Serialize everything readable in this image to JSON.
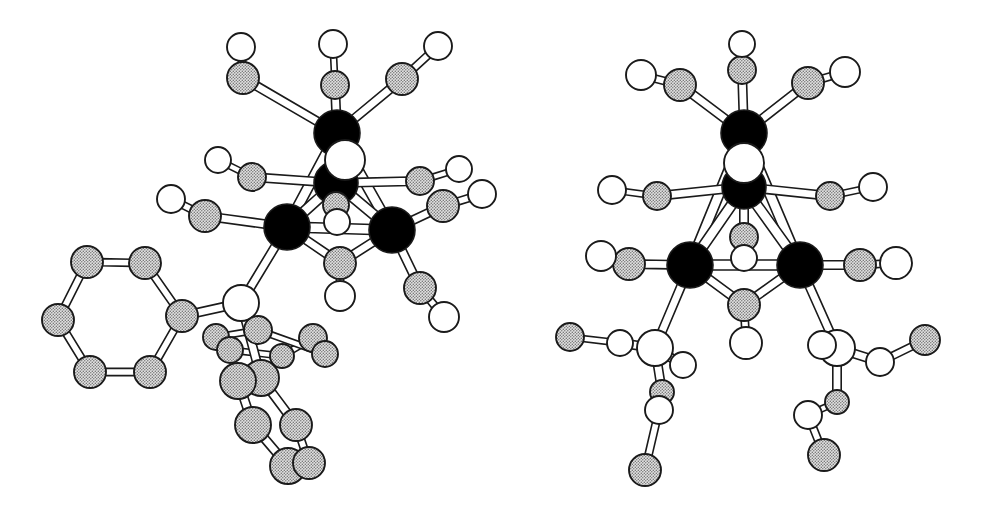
{
  "figure": {
    "background_color": "#ffffff",
    "width": 1003,
    "height": 506,
    "type": "crystal-structure-ortep",
    "caption": "",
    "structures": [
      {
        "id": "left",
        "label": "",
        "name": "triosmium-carbonyl-hydride-triphenylphosphine-cluster"
      },
      {
        "id": "right",
        "label": "",
        "name": "triosmium-carbonyl-hydride-bis-trimethylphosphite-cluster"
      }
    ]
  },
  "style": {
    "metal_fill": "#000000",
    "carbon_fill": "#c9c9c9",
    "oxygen_fill": "#ffffff",
    "phosphorus_fill": "#ffffff",
    "outline_color": "#1a1a1a",
    "bond_fill": "#ffffff",
    "bond_edge": "#1a1a1a",
    "stipple_color": "#7d7d7d"
  },
  "legend": {
    "metal_label": "M",
    "carbon_label": "C",
    "oxygen_label": "O",
    "phosphorus_label": "P"
  },
  "chart_data": {
    "type": "scatter",
    "title": "",
    "subtitle": "",
    "xlabel": "",
    "ylabel": "",
    "grid": false,
    "legend_position": "none",
    "xlim": [
      0,
      1003
    ],
    "ylim": [
      0,
      506
    ],
    "note": "Atom positions are image-pixel coordinates; r = drawn radius px; kind = atom class",
    "atoms": [
      {
        "id": "L-M1",
        "kind": "metal",
        "x": 337,
        "y": 133,
        "r": 23
      },
      {
        "id": "L-M2",
        "kind": "metal",
        "x": 336,
        "y": 183,
        "r": 22
      },
      {
        "id": "L-M3",
        "kind": "metal",
        "x": 287,
        "y": 227,
        "r": 23
      },
      {
        "id": "L-M4",
        "kind": "metal",
        "x": 392,
        "y": 230,
        "r": 23
      },
      {
        "id": "L-H1",
        "kind": "oxygen",
        "x": 345,
        "y": 160,
        "r": 20
      },
      {
        "id": "L-C11",
        "kind": "carbon",
        "x": 243,
        "y": 78,
        "r": 16
      },
      {
        "id": "L-O11",
        "kind": "oxygen",
        "x": 241,
        "y": 47,
        "r": 14
      },
      {
        "id": "L-C12",
        "kind": "carbon",
        "x": 335,
        "y": 85,
        "r": 14
      },
      {
        "id": "L-O12",
        "kind": "oxygen",
        "x": 333,
        "y": 44,
        "r": 14
      },
      {
        "id": "L-C13",
        "kind": "carbon",
        "x": 402,
        "y": 79,
        "r": 16
      },
      {
        "id": "L-O13",
        "kind": "oxygen",
        "x": 438,
        "y": 46,
        "r": 14
      },
      {
        "id": "L-C21",
        "kind": "carbon",
        "x": 252,
        "y": 177,
        "r": 14
      },
      {
        "id": "L-O21",
        "kind": "oxygen",
        "x": 218,
        "y": 160,
        "r": 13
      },
      {
        "id": "L-C22",
        "kind": "carbon",
        "x": 420,
        "y": 181,
        "r": 14
      },
      {
        "id": "L-O22",
        "kind": "oxygen",
        "x": 459,
        "y": 169,
        "r": 13
      },
      {
        "id": "L-C23",
        "kind": "carbon",
        "x": 336,
        "y": 205,
        "r": 13
      },
      {
        "id": "L-O23",
        "kind": "oxygen",
        "x": 337,
        "y": 222,
        "r": 13
      },
      {
        "id": "L-C31",
        "kind": "carbon",
        "x": 205,
        "y": 216,
        "r": 16
      },
      {
        "id": "L-O31",
        "kind": "oxygen",
        "x": 171,
        "y": 199,
        "r": 14
      },
      {
        "id": "L-C32",
        "kind": "carbon",
        "x": 340,
        "y": 263,
        "r": 16
      },
      {
        "id": "L-O32",
        "kind": "oxygen",
        "x": 340,
        "y": 296,
        "r": 15
      },
      {
        "id": "L-C41",
        "kind": "carbon",
        "x": 443,
        "y": 206,
        "r": 16
      },
      {
        "id": "L-O41",
        "kind": "oxygen",
        "x": 482,
        "y": 194,
        "r": 14
      },
      {
        "id": "L-C42",
        "kind": "carbon",
        "x": 420,
        "y": 288,
        "r": 16
      },
      {
        "id": "L-O42",
        "kind": "oxygen",
        "x": 444,
        "y": 317,
        "r": 15
      },
      {
        "id": "L-P1",
        "kind": "phosphorus",
        "x": 241,
        "y": 303,
        "r": 18
      },
      {
        "id": "L-Ph1C1",
        "kind": "carbon",
        "x": 182,
        "y": 316,
        "r": 16
      },
      {
        "id": "L-Ph1C2",
        "kind": "carbon",
        "x": 145,
        "y": 263,
        "r": 16
      },
      {
        "id": "L-Ph1C3",
        "kind": "carbon",
        "x": 87,
        "y": 262,
        "r": 16
      },
      {
        "id": "L-Ph1C4",
        "kind": "carbon",
        "x": 58,
        "y": 320,
        "r": 16
      },
      {
        "id": "L-Ph1C5",
        "kind": "carbon",
        "x": 90,
        "y": 372,
        "r": 16
      },
      {
        "id": "L-Ph1C6",
        "kind": "carbon",
        "x": 150,
        "y": 372,
        "r": 16
      },
      {
        "id": "L-Ph2C1",
        "kind": "carbon",
        "x": 258,
        "y": 330,
        "r": 14
      },
      {
        "id": "L-Ph2C2",
        "kind": "carbon",
        "x": 216,
        "y": 337,
        "r": 13
      },
      {
        "id": "L-Ph2C3",
        "kind": "carbon",
        "x": 230,
        "y": 350,
        "r": 13
      },
      {
        "id": "L-Ph2C4",
        "kind": "carbon",
        "x": 282,
        "y": 356,
        "r": 12
      },
      {
        "id": "L-Ph2C5",
        "kind": "carbon",
        "x": 313,
        "y": 338,
        "r": 14
      },
      {
        "id": "L-Ph2C6",
        "kind": "carbon",
        "x": 325,
        "y": 354,
        "r": 13
      },
      {
        "id": "L-Ph3C1",
        "kind": "carbon",
        "x": 261,
        "y": 378,
        "r": 18
      },
      {
        "id": "L-Ph3C2",
        "kind": "carbon",
        "x": 238,
        "y": 381,
        "r": 18
      },
      {
        "id": "L-Ph3C3",
        "kind": "carbon",
        "x": 253,
        "y": 425,
        "r": 18
      },
      {
        "id": "L-Ph3C4",
        "kind": "carbon",
        "x": 296,
        "y": 425,
        "r": 16
      },
      {
        "id": "L-Ph3C5",
        "kind": "carbon",
        "x": 288,
        "y": 466,
        "r": 18
      },
      {
        "id": "L-Ph3C6",
        "kind": "carbon",
        "x": 309,
        "y": 463,
        "r": 16
      },
      {
        "id": "R-M1",
        "kind": "metal",
        "x": 744,
        "y": 133,
        "r": 23
      },
      {
        "id": "R-M2",
        "kind": "metal",
        "x": 744,
        "y": 187,
        "r": 22
      },
      {
        "id": "R-M3",
        "kind": "metal",
        "x": 690,
        "y": 265,
        "r": 23
      },
      {
        "id": "R-M4",
        "kind": "metal",
        "x": 800,
        "y": 265,
        "r": 23
      },
      {
        "id": "R-H1",
        "kind": "oxygen",
        "x": 744,
        "y": 163,
        "r": 20
      },
      {
        "id": "R-C11",
        "kind": "carbon",
        "x": 680,
        "y": 85,
        "r": 16
      },
      {
        "id": "R-O11",
        "kind": "oxygen",
        "x": 641,
        "y": 75,
        "r": 15
      },
      {
        "id": "R-C12",
        "kind": "carbon",
        "x": 742,
        "y": 70,
        "r": 14
      },
      {
        "id": "R-O12",
        "kind": "oxygen",
        "x": 742,
        "y": 44,
        "r": 13
      },
      {
        "id": "R-C13",
        "kind": "carbon",
        "x": 808,
        "y": 83,
        "r": 16
      },
      {
        "id": "R-O13",
        "kind": "oxygen",
        "x": 845,
        "y": 72,
        "r": 15
      },
      {
        "id": "R-C21",
        "kind": "carbon",
        "x": 657,
        "y": 196,
        "r": 14
      },
      {
        "id": "R-O21",
        "kind": "oxygen",
        "x": 612,
        "y": 190,
        "r": 14
      },
      {
        "id": "R-C22",
        "kind": "carbon",
        "x": 830,
        "y": 196,
        "r": 14
      },
      {
        "id": "R-O22",
        "kind": "oxygen",
        "x": 873,
        "y": 187,
        "r": 14
      },
      {
        "id": "R-C23",
        "kind": "carbon",
        "x": 744,
        "y": 237,
        "r": 14
      },
      {
        "id": "R-O23",
        "kind": "oxygen",
        "x": 744,
        "y": 258,
        "r": 13
      },
      {
        "id": "R-C31",
        "kind": "carbon",
        "x": 629,
        "y": 264,
        "r": 16
      },
      {
        "id": "R-O31",
        "kind": "oxygen",
        "x": 601,
        "y": 256,
        "r": 15
      },
      {
        "id": "R-C32",
        "kind": "carbon",
        "x": 744,
        "y": 305,
        "r": 16
      },
      {
        "id": "R-O32",
        "kind": "oxygen",
        "x": 746,
        "y": 343,
        "r": 16
      },
      {
        "id": "R-C41",
        "kind": "carbon",
        "x": 860,
        "y": 265,
        "r": 16
      },
      {
        "id": "R-O41",
        "kind": "oxygen",
        "x": 896,
        "y": 263,
        "r": 16
      },
      {
        "id": "R-P1",
        "kind": "phosphorus",
        "x": 655,
        "y": 348,
        "r": 18
      },
      {
        "id": "R-PO11",
        "kind": "oxygen",
        "x": 620,
        "y": 343,
        "r": 13
      },
      {
        "id": "R-PC11",
        "kind": "carbon",
        "x": 570,
        "y": 337,
        "r": 14
      },
      {
        "id": "R-PO12",
        "kind": "oxygen",
        "x": 683,
        "y": 365,
        "r": 13
      },
      {
        "id": "R-PC12",
        "kind": "carbon",
        "x": 662,
        "y": 392,
        "r": 12
      },
      {
        "id": "R-PO13",
        "kind": "oxygen",
        "x": 659,
        "y": 410,
        "r": 14
      },
      {
        "id": "R-PC13",
        "kind": "carbon",
        "x": 645,
        "y": 470,
        "r": 16
      },
      {
        "id": "R-P2",
        "kind": "phosphorus",
        "x": 837,
        "y": 348,
        "r": 18
      },
      {
        "id": "R-PO21",
        "kind": "oxygen",
        "x": 880,
        "y": 362,
        "r": 14
      },
      {
        "id": "R-PC21",
        "kind": "carbon",
        "x": 925,
        "y": 340,
        "r": 15
      },
      {
        "id": "R-PO22",
        "kind": "oxygen",
        "x": 822,
        "y": 345,
        "r": 14
      },
      {
        "id": "R-PC22",
        "kind": "carbon",
        "x": 837,
        "y": 402,
        "r": 12
      },
      {
        "id": "R-PO23",
        "kind": "oxygen",
        "x": 808,
        "y": 415,
        "r": 14
      },
      {
        "id": "R-PC23",
        "kind": "carbon",
        "x": 824,
        "y": 455,
        "r": 16
      }
    ],
    "bonds": [
      [
        "L-M1",
        "L-M2"
      ],
      [
        "L-M1",
        "L-M3"
      ],
      [
        "L-M1",
        "L-M4"
      ],
      [
        "L-M2",
        "L-M3"
      ],
      [
        "L-M2",
        "L-M4"
      ],
      [
        "L-M3",
        "L-M4"
      ],
      [
        "L-M1",
        "L-C11"
      ],
      [
        "L-C11",
        "L-O11"
      ],
      [
        "L-M1",
        "L-C12"
      ],
      [
        "L-C12",
        "L-O12"
      ],
      [
        "L-M1",
        "L-C13"
      ],
      [
        "L-C13",
        "L-O13"
      ],
      [
        "L-M2",
        "L-C21"
      ],
      [
        "L-C21",
        "L-O21"
      ],
      [
        "L-M2",
        "L-C22"
      ],
      [
        "L-C22",
        "L-O22"
      ],
      [
        "L-M2",
        "L-C23"
      ],
      [
        "L-C23",
        "L-O23"
      ],
      [
        "L-M3",
        "L-C31"
      ],
      [
        "L-C31",
        "L-O31"
      ],
      [
        "L-M3",
        "L-C32"
      ],
      [
        "L-C32",
        "L-O32"
      ],
      [
        "L-M4",
        "L-C32"
      ],
      [
        "L-M4",
        "L-C41"
      ],
      [
        "L-C41",
        "L-O41"
      ],
      [
        "L-M4",
        "L-C42"
      ],
      [
        "L-C42",
        "L-O42"
      ],
      [
        "L-M3",
        "L-P1"
      ],
      [
        "L-P1",
        "L-Ph1C1"
      ],
      [
        "L-Ph1C1",
        "L-Ph1C2"
      ],
      [
        "L-Ph1C2",
        "L-Ph1C3"
      ],
      [
        "L-Ph1C3",
        "L-Ph1C4"
      ],
      [
        "L-Ph1C4",
        "L-Ph1C5"
      ],
      [
        "L-Ph1C5",
        "L-Ph1C6"
      ],
      [
        "L-Ph1C6",
        "L-Ph1C1"
      ],
      [
        "L-P1",
        "L-Ph2C1"
      ],
      [
        "L-Ph2C1",
        "L-Ph2C2"
      ],
      [
        "L-Ph2C2",
        "L-Ph2C3"
      ],
      [
        "L-Ph2C3",
        "L-Ph2C4"
      ],
      [
        "L-Ph2C4",
        "L-Ph2C5"
      ],
      [
        "L-Ph2C5",
        "L-Ph2C6"
      ],
      [
        "L-Ph2C6",
        "L-Ph2C1"
      ],
      [
        "L-P1",
        "L-Ph3C1"
      ],
      [
        "L-Ph3C1",
        "L-Ph3C2"
      ],
      [
        "L-Ph3C2",
        "L-Ph3C3"
      ],
      [
        "L-Ph3C3",
        "L-Ph3C5"
      ],
      [
        "L-Ph3C5",
        "L-Ph3C6"
      ],
      [
        "L-Ph3C6",
        "L-Ph3C4"
      ],
      [
        "L-Ph3C4",
        "L-Ph3C1"
      ],
      [
        "R-M1",
        "R-M2"
      ],
      [
        "R-M1",
        "R-M3"
      ],
      [
        "R-M1",
        "R-M4"
      ],
      [
        "R-M2",
        "R-M3"
      ],
      [
        "R-M2",
        "R-M4"
      ],
      [
        "R-M3",
        "R-M4"
      ],
      [
        "R-M1",
        "R-C11"
      ],
      [
        "R-C11",
        "R-O11"
      ],
      [
        "R-M1",
        "R-C12"
      ],
      [
        "R-C12",
        "R-O12"
      ],
      [
        "R-M1",
        "R-C13"
      ],
      [
        "R-C13",
        "R-O13"
      ],
      [
        "R-M2",
        "R-C21"
      ],
      [
        "R-C21",
        "R-O21"
      ],
      [
        "R-M2",
        "R-C22"
      ],
      [
        "R-C22",
        "R-O22"
      ],
      [
        "R-M2",
        "R-C23"
      ],
      [
        "R-C23",
        "R-O23"
      ],
      [
        "R-M3",
        "R-C31"
      ],
      [
        "R-C31",
        "R-O31"
      ],
      [
        "R-M3",
        "R-C32"
      ],
      [
        "R-M4",
        "R-C32"
      ],
      [
        "R-C32",
        "R-O32"
      ],
      [
        "R-M4",
        "R-C41"
      ],
      [
        "R-C41",
        "R-O41"
      ],
      [
        "R-M3",
        "R-P1"
      ],
      [
        "R-P1",
        "R-PO11"
      ],
      [
        "R-PO11",
        "R-PC11"
      ],
      [
        "R-P1",
        "R-PO12"
      ],
      [
        "R-P1",
        "R-PC12"
      ],
      [
        "R-PC12",
        "R-PO13"
      ],
      [
        "R-PO13",
        "R-PC13"
      ],
      [
        "R-M4",
        "R-P2"
      ],
      [
        "R-P2",
        "R-PO21"
      ],
      [
        "R-PO21",
        "R-PC21"
      ],
      [
        "R-P2",
        "R-PO22"
      ],
      [
        "R-P2",
        "R-PC22"
      ],
      [
        "R-PC22",
        "R-PO23"
      ],
      [
        "R-PO23",
        "R-PC23"
      ]
    ]
  }
}
